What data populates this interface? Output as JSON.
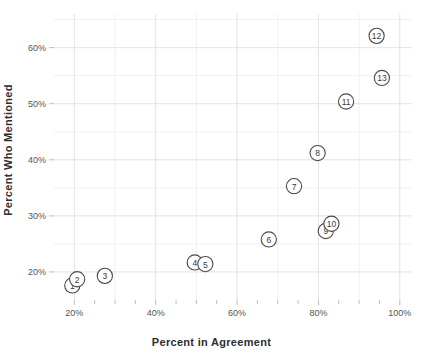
{
  "chart_data": {
    "type": "scatter",
    "title": "",
    "xlabel": "Percent in Agreement",
    "ylabel": "Percent Who Mentioned",
    "xlim": [
      15,
      103
    ],
    "ylim": [
      15,
      66
    ],
    "xticks": [
      20,
      40,
      60,
      80,
      100
    ],
    "xtick_labels": [
      "20%",
      "40%",
      "60%",
      "80%",
      "100%"
    ],
    "yticks": [
      20,
      30,
      40,
      50,
      60
    ],
    "ytick_labels": [
      "20%",
      "30%",
      "40%",
      "50%",
      "60%"
    ],
    "x_minor_step": 10,
    "y_minor_step": 5,
    "grid": true,
    "legend": "none",
    "marker": "numbered-open-circle",
    "points": [
      {
        "label": "1",
        "x": 19.5,
        "y": 17.6
      },
      {
        "label": "2",
        "x": 20.7,
        "y": 18.7
      },
      {
        "label": "3",
        "x": 27.5,
        "y": 19.3
      },
      {
        "label": "4",
        "x": 49.6,
        "y": 21.7
      },
      {
        "label": "5",
        "x": 52.2,
        "y": 21.4
      },
      {
        "label": "6",
        "x": 67.8,
        "y": 25.8
      },
      {
        "label": "7",
        "x": 74.0,
        "y": 35.3
      },
      {
        "label": "8",
        "x": 79.8,
        "y": 41.2
      },
      {
        "label": "9",
        "x": 81.8,
        "y": 27.3
      },
      {
        "label": "10",
        "x": 83.2,
        "y": 28.6
      },
      {
        "label": "11",
        "x": 86.8,
        "y": 50.4
      },
      {
        "label": "12",
        "x": 94.3,
        "y": 62.1
      },
      {
        "label": "13",
        "x": 95.6,
        "y": 54.6
      }
    ]
  },
  "colors": {
    "background": "#ffffff",
    "gridline_major": "#e2e2e2",
    "gridline_minor": "#f0f0f0",
    "tick_mark": "#bdbdbd",
    "marker_stroke": "#4a4a4a",
    "marker_fill": "#ffffff",
    "text": "#3a3a3a"
  }
}
